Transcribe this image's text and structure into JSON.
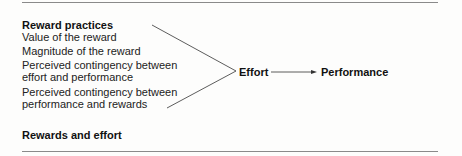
{
  "diagram": {
    "title": "Reward practices",
    "factors": [
      "Value of the reward",
      "Magnitude of the reward",
      "Perceived contingency between",
      "effort and performance",
      "Perceived contingency between",
      "performance and rewards"
    ],
    "effort_label": "Effort",
    "performance_label": "Performance",
    "caption": "Rewards and effort"
  }
}
